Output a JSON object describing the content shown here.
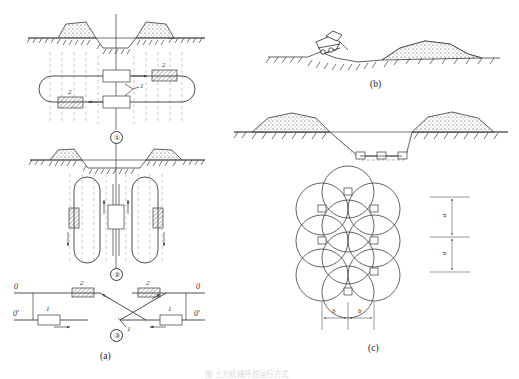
{
  "figure": {
    "title_caption": "图  土方机械开挖运行方式",
    "domain": "engineering-excavation-diagram"
  },
  "panels": [
    {
      "id": "a",
      "label": "(a)",
      "desc": "multi-pass trench excavation running schemes"
    },
    {
      "id": "b",
      "label": "(b)",
      "desc": "dozer pushing soil into spoil heap"
    },
    {
      "id": "c",
      "label": "(c)",
      "desc": "wide cut section and overlapping swing-circle layout"
    }
  ],
  "panel_a": {
    "scheme1": {
      "marker": "①",
      "machine_labels": [
        {
          "id": "m1",
          "text": "1"
        },
        {
          "id": "m2a",
          "text": "2"
        },
        {
          "id": "m2b",
          "text": "2"
        }
      ]
    },
    "scheme2": {
      "marker": "②"
    },
    "scheme3": {
      "marker": "③",
      "axis_labels": [
        {
          "id": "o-top-left",
          "text": "0"
        },
        {
          "id": "o-prime-bottom-left",
          "text": "0'"
        },
        {
          "id": "o-top-right",
          "text": "0"
        },
        {
          "id": "o-prime-bottom-right",
          "text": "0'"
        }
      ],
      "machine_labels": [
        {
          "id": "left-1",
          "text": "1"
        },
        {
          "id": "left-2",
          "text": "2"
        },
        {
          "id": "right-2",
          "text": "2"
        },
        {
          "id": "right-1",
          "text": "1"
        }
      ],
      "callout": "1"
    }
  },
  "panel_c": {
    "dimensions": [
      {
        "id": "a-upper",
        "text": "a",
        "orientation": "vertical"
      },
      {
        "id": "a-lower",
        "text": "a",
        "orientation": "vertical"
      },
      {
        "id": "b-left",
        "text": "b",
        "orientation": "horizontal"
      },
      {
        "id": "b-right",
        "text": "b",
        "orientation": "horizontal"
      }
    ]
  },
  "colors": {
    "ink": "#3a3a3a",
    "dash": "#b5b5b5",
    "paper": "#ffffff"
  }
}
